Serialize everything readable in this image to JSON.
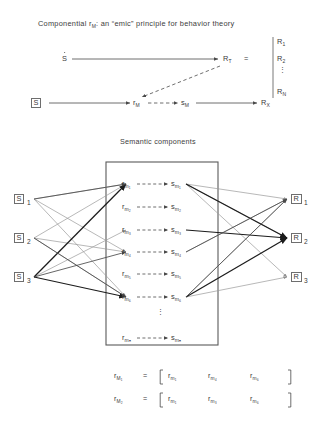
{
  "figure": {
    "title_parts": {
      "lead": "Componential ",
      "sym": "r",
      "sym_sub": "M",
      "rest": ": an “emic” principle for behavior theory"
    },
    "section_label": "Semantic components",
    "background_color": "#ffffff",
    "ink_color": "#3a3a3a",
    "bold_link_color": "#1c1c1c",
    "light_link_color": "#9a9a9a"
  },
  "top_diagram": {
    "nodes": [
      {
        "name": "s-dot",
        "base": "S",
        "sub": "",
        "overdot": true,
        "boxed": false
      },
      {
        "name": "r-total",
        "base": "R",
        "sub": "T",
        "overdot": false,
        "boxed": false
      },
      {
        "name": "s-boxed",
        "base": "S",
        "sub": "",
        "overdot": false,
        "boxed": true
      },
      {
        "name": "r-m",
        "base": "r",
        "sub": "M",
        "overdot": false,
        "boxed": false
      },
      {
        "name": "s-m",
        "base": "s",
        "sub": "M",
        "overdot": false,
        "boxed": false
      },
      {
        "name": "r-x",
        "base": "R",
        "sub": "X",
        "overdot": false,
        "boxed": false
      }
    ],
    "equals_sign": "=",
    "vector_label": "R vector",
    "vector_items": [
      {
        "base": "R",
        "sub": "1"
      },
      {
        "base": "R",
        "sub": "2"
      },
      {
        "base": "⋮",
        "sub": ""
      },
      {
        "base": "R",
        "sub": "N"
      }
    ],
    "edges": [
      {
        "from": "s-dot",
        "to": "r-total",
        "style": "solid"
      },
      {
        "from": "s-boxed",
        "to": "r-m",
        "style": "solid"
      },
      {
        "from": "r-m",
        "to": "s-m",
        "style": "dashed"
      },
      {
        "from": "s-m",
        "to": "r-x",
        "style": "solid"
      },
      {
        "from": "r-m",
        "to": "r-total",
        "style": "dashed"
      }
    ]
  },
  "main_diagram": {
    "stimuli": [
      {
        "base": "S",
        "sub": "1"
      },
      {
        "base": "S",
        "sub": "2"
      },
      {
        "base": "S",
        "sub": "3"
      }
    ],
    "responses": [
      {
        "base": "R",
        "sub": "1"
      },
      {
        "base": "R",
        "sub": "2"
      },
      {
        "base": "R",
        "sub": "3"
      }
    ],
    "components": [
      {
        "r_base": "r",
        "r_sub": "m₁",
        "s_base": "s",
        "s_sub": "m₁"
      },
      {
        "r_base": "r",
        "r_sub": "m₂",
        "s_base": "s",
        "s_sub": "m₂"
      },
      {
        "r_base": "r",
        "r_sub": "m₃",
        "s_base": "s",
        "s_sub": "m₃"
      },
      {
        "r_base": "r",
        "r_sub": "m₄",
        "s_base": "s",
        "s_sub": "m₄"
      },
      {
        "r_base": "r",
        "r_sub": "m₅",
        "s_base": "s",
        "s_sub": "m₅"
      },
      {
        "r_base": "r",
        "r_sub": "m₆",
        "s_base": "s",
        "s_sub": "m₆"
      },
      {
        "r_base": "r",
        "r_sub": "mₙ",
        "s_base": "s",
        "s_sub": "mₙ"
      }
    ],
    "ellipsis": "⋮"
  },
  "equations": [
    {
      "lhs_base": "r",
      "lhs_sub": "M₁",
      "equals": "=",
      "open": "[",
      "terms": [
        {
          "base": "r",
          "sub": "m₁"
        },
        {
          "base": "r",
          "sub": "m₄"
        },
        {
          "base": "r",
          "sub": "m₆"
        }
      ],
      "close": "]"
    },
    {
      "lhs_base": "r",
      "lhs_sub": "M₂",
      "equals": "=",
      "open": "[",
      "terms": [
        {
          "base": "r",
          "sub": "m₁"
        },
        {
          "base": "r",
          "sub": "m₃"
        },
        {
          "base": "r",
          "sub": "m₆"
        }
      ],
      "close": "]"
    }
  ]
}
